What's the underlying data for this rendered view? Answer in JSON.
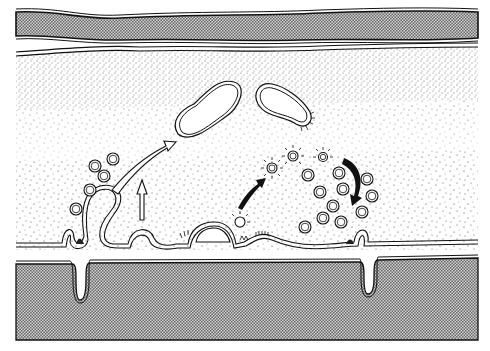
{
  "figure": {
    "title": "",
    "colors": {
      "background": "#ffffff",
      "ink": "#111111",
      "dense_stipple": "#8a8a8a",
      "sparse_stipple": "#555555"
    },
    "layers": [
      {
        "name": "top-cell-layer",
        "fill": "crosshatch"
      },
      {
        "name": "cytoplasm-layer",
        "fill": "stipple"
      },
      {
        "name": "bottom-cell-layer",
        "fill": "crosshatch"
      }
    ],
    "vesicle_count_left": 6,
    "vesicle_count_right": 13,
    "coated_vesicle_count": 3,
    "large_vacuoles": 2,
    "arrows": [
      {
        "name": "open-curved-arrow",
        "style": "outline"
      },
      {
        "name": "open-straight-arrow",
        "style": "outline"
      },
      {
        "name": "solid-curved-arrow-up",
        "style": "filled"
      },
      {
        "name": "solid-curved-arrow-down",
        "style": "filled"
      }
    ]
  }
}
